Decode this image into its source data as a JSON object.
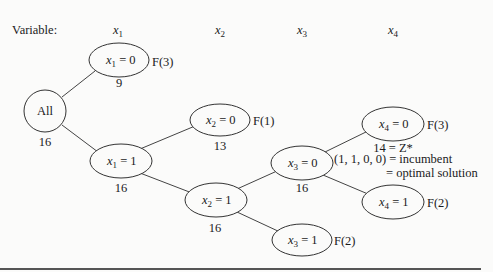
{
  "header": {
    "variable_label": "Variable:",
    "columns": [
      {
        "var": "x",
        "sub": "1"
      },
      {
        "var": "x",
        "sub": "2"
      },
      {
        "var": "x",
        "sub": "3"
      },
      {
        "var": "x",
        "sub": "4"
      }
    ]
  },
  "tree": {
    "root": {
      "label": "All",
      "bound": "16"
    },
    "nodes": {
      "x1_0": {
        "var": "x",
        "sub": "1",
        "eq": " = 0",
        "bound": "9",
        "fathom": "F(3)"
      },
      "x1_1": {
        "var": "x",
        "sub": "1",
        "eq": " = 1",
        "bound": "16"
      },
      "x2_0": {
        "var": "x",
        "sub": "2",
        "eq": " = 0",
        "bound": "13",
        "fathom": "F(1)"
      },
      "x2_1": {
        "var": "x",
        "sub": "2",
        "eq": " = 1",
        "bound": "16"
      },
      "x3_0": {
        "var": "x",
        "sub": "3",
        "eq": " = 0",
        "bound": "16"
      },
      "x3_1": {
        "var": "x",
        "sub": "3",
        "eq": " = 1",
        "fathom": "F(2)"
      },
      "x4_0": {
        "var": "x",
        "sub": "4",
        "eq": " = 0",
        "bound": "14 = Z*",
        "fathom": "F(3)"
      },
      "x4_1": {
        "var": "x",
        "sub": "4",
        "eq": " = 1",
        "fathom": "F(2)"
      }
    },
    "annotation": {
      "incumbent": "(1, 1, 0, 0)  = incumbent",
      "optimal": "= optimal solution"
    }
  }
}
